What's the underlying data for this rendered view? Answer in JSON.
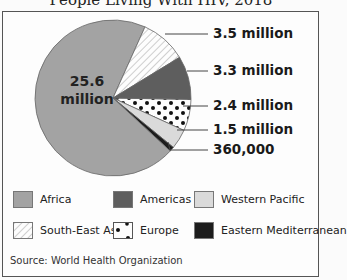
{
  "chart_data": {
    "type": "pie",
    "title": "People Living With HIV, 2018",
    "categories": [
      "Africa",
      "South-East Asia",
      "Americas",
      "Europe",
      "Western Pacific",
      "Eastern Mediterranean"
    ],
    "values": [
      25600000,
      3500000,
      3300000,
      2400000,
      1500000,
      360000
    ],
    "data_labels": [
      "25.6 million",
      "3.5 million",
      "3.3 million",
      "2.4 million",
      "1.5 million",
      "360,000"
    ],
    "legend": [
      "Africa",
      "Americas",
      "Western Pacific",
      "South-East Asia",
      "Europe",
      "Eastern Mediterranean"
    ],
    "legend_position": "bottom",
    "source": "Source: World Health Organization"
  },
  "colors": {
    "Africa": "#a3a3a3",
    "Americas": "#5e5e5e",
    "Western Pacific": "#dadada",
    "South-East Asia": "hatch",
    "Europe": "dots",
    "Eastern Mediterranean": "#1c1c1c"
  },
  "labels": {
    "africa_line1": "25.6",
    "africa_line2": "million",
    "sea": "3.5 million",
    "americas": "3.3 million",
    "europe": "2.4 million",
    "wp": "1.5 million",
    "em": "360,000"
  },
  "legend": {
    "africa": "Africa",
    "americas": "Americas",
    "wp": "Western Pacific",
    "sea": "South-East Asia",
    "europe": "Europe",
    "em": "Eastern Mediterranean"
  }
}
